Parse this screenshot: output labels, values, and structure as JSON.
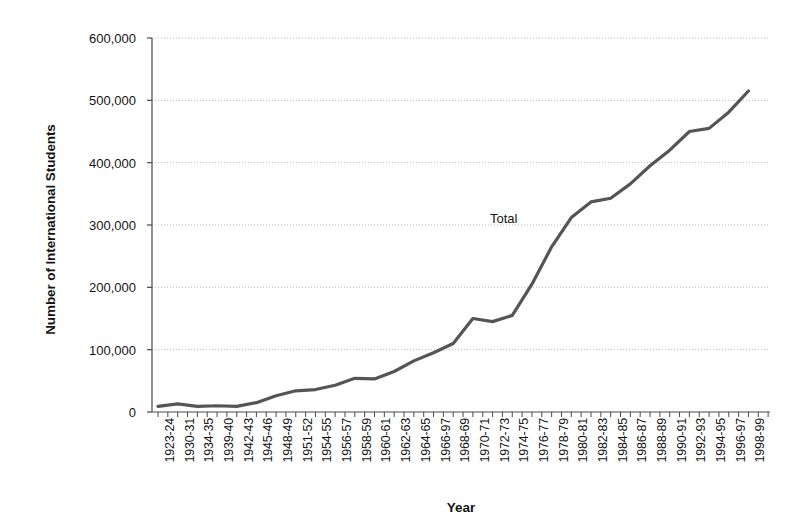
{
  "chart_data": {
    "type": "line",
    "title": "",
    "xlabel": "Year",
    "ylabel": "Number of International Students",
    "grid": true,
    "legend_position": "inline-annotation",
    "ylim": [
      0,
      600000
    ],
    "y_ticks": [
      "0",
      "100,000",
      "200,000",
      "300,000",
      "400,000",
      "500,000",
      "600,000"
    ],
    "y_tick_values": [
      0,
      100000,
      200000,
      300000,
      400000,
      500000,
      600000
    ],
    "x_tick_labels": [
      "1923-24",
      "1930-31",
      "1934-35",
      "1939-40",
      "1942-43",
      "1945-46",
      "1948-49",
      "1951-52",
      "1954-55",
      "1956-57",
      "1958-59",
      "1960-61",
      "1962-63",
      "1964-65",
      "1966-97",
      "1968-69",
      "1970-71",
      "1972-73",
      "1974-75",
      "1976-77",
      "1978-79",
      "1980-81",
      "1982-83",
      "1984-85",
      "1986-87",
      "1988-89",
      "1990-91",
      "1992-93",
      "1994-95",
      "1996-97",
      "1998-99"
    ],
    "annotations": [
      {
        "text": "Total",
        "x_index": 19,
        "y_value": 310000
      }
    ],
    "series": [
      {
        "name": "Total",
        "color": "#555555",
        "categories": [
          "1923-24",
          "1930-31",
          "1934-35",
          "1939-40",
          "1942-43",
          "1945-46",
          "1948-49",
          "1951-52",
          "1954-55",
          "1956-57",
          "1958-59",
          "1960-61",
          "1962-63",
          "1964-65",
          "1966-97",
          "1968-69",
          "1970-71",
          "1972-73",
          "1974-75",
          "1976-77",
          "1978-79",
          "1980-81",
          "1982-83",
          "1984-85",
          "1986-87",
          "1988-89",
          "1990-91",
          "1992-93",
          "1994-95",
          "1996-97",
          "1998-99"
        ],
        "values": [
          9000,
          13000,
          9000,
          10000,
          9000,
          15000,
          26000,
          34000,
          36000,
          43000,
          54000,
          53000,
          65000,
          82000,
          95000,
          110000,
          150000,
          145000,
          155000,
          205000,
          265000,
          312000,
          337000,
          343000,
          366000,
          395000,
          420000,
          450000,
          455000,
          481000,
          515000
        ]
      }
    ]
  },
  "axes": {
    "y_title": "Number of International Students",
    "x_title": "Year"
  }
}
